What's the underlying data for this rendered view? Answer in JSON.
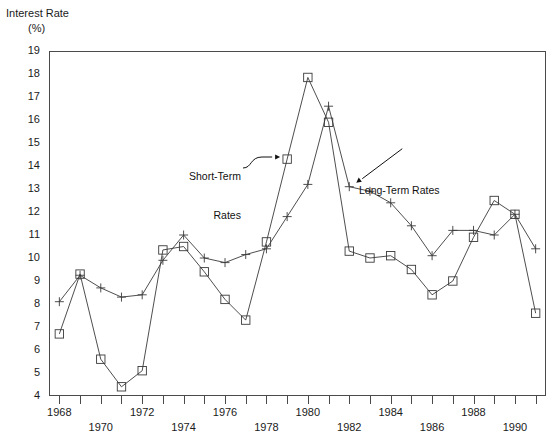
{
  "chart_data": {
    "type": "line",
    "title": "Interest Rate (%)",
    "ylabel_line1": "Interest Rate",
    "ylabel_line2": "(%)",
    "xlabel": "",
    "ylim": [
      4,
      19
    ],
    "xlim": [
      1967.5,
      1991.5
    ],
    "grid": false,
    "legend": "annotations",
    "yticks": [
      19,
      18,
      17,
      16,
      15,
      14,
      13,
      12,
      11,
      10,
      9,
      8,
      7,
      6,
      5,
      4
    ],
    "xticks": [
      1968,
      1969,
      1970,
      1971,
      1972,
      1973,
      1974,
      1975,
      1976,
      1977,
      1978,
      1979,
      1980,
      1981,
      1982,
      1983,
      1984,
      1985,
      1986,
      1987,
      1988,
      1989,
      1990,
      1991
    ],
    "xtick_labels": [
      "1968",
      "1970",
      "1972",
      "1974",
      "1976",
      "1978",
      "1980",
      "1982",
      "1984",
      "1986",
      "1988",
      "1990"
    ],
    "xtick_label_years": [
      1968,
      1970,
      1972,
      1974,
      1976,
      1978,
      1980,
      1982,
      1984,
      1986,
      1988,
      1990
    ],
    "x": [
      1968,
      1969,
      1970,
      1971,
      1972,
      1973,
      1974,
      1975,
      1976,
      1977,
      1978,
      1979,
      1980,
      1981,
      1982,
      1983,
      1984,
      1985,
      1986,
      1987,
      1988,
      1989,
      1990,
      1991
    ],
    "series": [
      {
        "name": "Short-Term Rates",
        "marker": "square",
        "values": [
          6.7,
          9.3,
          5.6,
          4.4,
          5.1,
          10.35,
          10.5,
          9.4,
          8.2,
          7.3,
          10.7,
          14.3,
          17.85,
          15.9,
          10.3,
          10.0,
          10.1,
          9.5,
          8.4,
          9.0,
          10.9,
          12.5,
          11.9,
          7.6
        ]
      },
      {
        "name": "Long-Term Rates",
        "marker": "plus",
        "values": [
          8.1,
          9.25,
          8.7,
          8.3,
          8.4,
          9.9,
          11.0,
          10.0,
          9.8,
          10.15,
          10.4,
          11.8,
          13.2,
          16.6,
          13.1,
          12.9,
          12.4,
          11.4,
          10.1,
          11.2,
          11.2,
          11.0,
          11.9,
          10.4
        ]
      }
    ],
    "recession_bands": [
      {
        "start": 1969.7,
        "end": 1970.6
      },
      {
        "start": 1974.3,
        "end": 1975.2
      },
      {
        "start": 1980.7,
        "end": 1981.6
      },
      {
        "start": 1989.9,
        "end": 1991.5
      }
    ],
    "annotations": [
      {
        "id": "short",
        "text_line1": "Short-Term",
        "text_line2": "Rates",
        "points_to_year": 1979,
        "points_to_value": 14.3
      },
      {
        "id": "long",
        "text_line1": "Long-Term Rates",
        "text_line2": "",
        "points_to_year": 1982,
        "points_to_value": 13.1
      }
    ],
    "colors": {
      "series_line": "#3a3a3a",
      "axis": "#4a4a4a",
      "band": "#e6e6e6",
      "text": "#1a1a1a",
      "background": "#ffffff"
    }
  }
}
